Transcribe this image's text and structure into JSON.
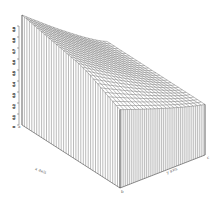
{
  "chart_data": {
    "type": "surface3d",
    "title": "",
    "style": "wireframe mesh with vertical hatched skirt",
    "grid_rows": 26,
    "grid_cols": 22,
    "x_axis": {
      "label": "x axis",
      "range": [
        0,
        1
      ]
    },
    "y_axis": {
      "label": "y axis",
      "range": [
        0,
        1
      ]
    },
    "z_axis": {
      "label": "z",
      "ticks": [
        "0",
        "0.1",
        "0.2",
        "0.3",
        "0.4",
        "0.5",
        "0.6",
        "0.7",
        "0.8",
        "0.9"
      ]
    },
    "corner_labels": [
      "a",
      "b",
      "c"
    ],
    "colors": {
      "line": "#555555",
      "background": "#ffffff"
    }
  }
}
